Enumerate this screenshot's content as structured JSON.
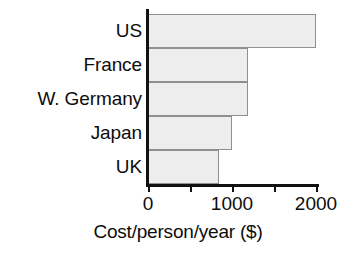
{
  "chart_data": {
    "type": "bar",
    "orientation": "horizontal",
    "title": "",
    "categories": [
      "US",
      "France",
      "W. Germany",
      "Japan",
      "UK"
    ],
    "values": [
      2000,
      1190,
      1190,
      1000,
      840
    ],
    "xlabel": "Cost/person/year ($)",
    "ylabel": "",
    "xlim": [
      0,
      2000
    ],
    "xticks": [
      0,
      500,
      1000,
      1500,
      2000
    ],
    "xtick_labels": [
      "0",
      "",
      "1000",
      "",
      "2000"
    ],
    "grid": false,
    "legend": null,
    "bar_fill_color": "#ededed",
    "bar_border_color": "#8f8f8f",
    "axis_color": "#111111"
  },
  "axis": {
    "x_title": "Cost/person/year ($)",
    "tick_labels": [
      {
        "value": 0,
        "text": "0"
      },
      {
        "value": 1000,
        "text": "1000"
      },
      {
        "value": 2000,
        "text": "2000"
      }
    ]
  }
}
